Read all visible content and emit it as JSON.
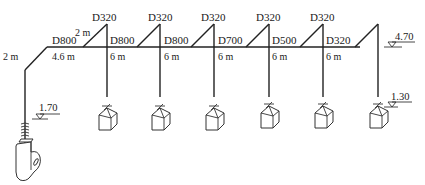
{
  "diagram": {
    "type": "duct-system-isometric",
    "main_duct": {
      "inlet_segment_length": "2 m",
      "first_segment_diameter": "D800",
      "first_segment_length": "4.6 m",
      "first_riser_length": "2 m"
    },
    "branches": [
      {
        "riser_diameter": "D320",
        "main_diameter_after": "D800",
        "drop_length": "6 m"
      },
      {
        "riser_diameter": "D320",
        "main_diameter_after": "D800",
        "drop_length": "6 m"
      },
      {
        "riser_diameter": "D320",
        "main_diameter_after": "D700",
        "drop_length": "6 m"
      },
      {
        "riser_diameter": "D320",
        "main_diameter_after": "D500",
        "drop_length": "6 m"
      },
      {
        "riser_diameter": "D320",
        "main_diameter_after": "D320",
        "drop_length": "6 m"
      }
    ],
    "elevations": {
      "fan": "1.70",
      "main_right": "4.70",
      "hood_right": "1.30"
    },
    "components": [
      "fan",
      "hood",
      "hood",
      "hood",
      "hood",
      "hood",
      "hood"
    ]
  }
}
